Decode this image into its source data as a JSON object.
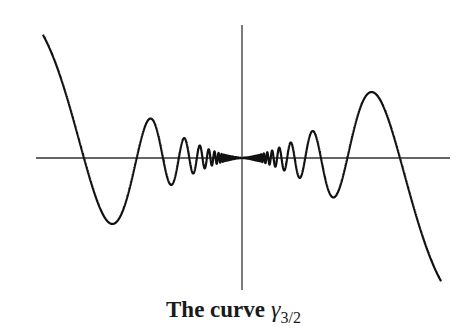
{
  "figure": {
    "caption_text": "The curve",
    "caption_symbol": "γ",
    "caption_subscript": "3/2"
  },
  "chart_data": {
    "type": "line",
    "function": "y = |x|^{3/2} sin(π/x) (odd, oscillating toward origin)",
    "xlabel": "",
    "ylabel": "",
    "xlim": [
      -0.63,
      0.63
    ],
    "ylim": [
      -0.52,
      0.52
    ],
    "axes": {
      "horizontal": true,
      "vertical": true,
      "ticks": false
    },
    "grid": false,
    "zero_crossings_x": [
      -0.5,
      -0.333,
      -0.25,
      0,
      0.25,
      0.333,
      0.5
    ],
    "series": [
      {
        "name": "γ_{3/2}",
        "color": "#111111"
      }
    ],
    "pixel": {
      "origin": [
        242,
        158
      ],
      "x_scale": 316,
      "y_scale": 256,
      "x_axis": [
        36,
        450
      ],
      "y_axis": [
        25,
        290
      ]
    }
  },
  "colors": {
    "ink": "#111111",
    "axis": "#333333",
    "background": "#ffffff"
  }
}
